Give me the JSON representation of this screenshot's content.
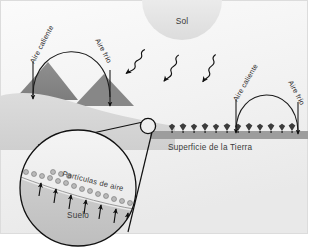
{
  "figure": {
    "title_visible": false,
    "language": "es",
    "background_color": "#f6f6f6",
    "frame_color": "#d8d8d8"
  },
  "sun": {
    "label": "Sol",
    "shape": "half-circle",
    "fill_color": "#e3e3e3"
  },
  "rays": {
    "icon_name": "wavy-ray-arrow",
    "count": 3,
    "direction": "down-left",
    "color": "#111111"
  },
  "left_cell": {
    "hot_label": "Aire caliente",
    "cold_label": "Aire frío",
    "terrain": "mountains",
    "terrain_color": "#8a8a8a"
  },
  "right_cell": {
    "hot_label": "Aire caliente",
    "cold_label": "Aire frío",
    "terrain": "trees",
    "terrain_color": "#3c3c3c"
  },
  "ground": {
    "surface_label": "Superficie de la Tierra",
    "band_color": "#9d9d9d"
  },
  "magnifier": {
    "particles_label": "Partículas de aire",
    "soil_label": "Suelo",
    "particle_count": 17,
    "soil_arrow_count": 7,
    "particle_color": "#b9b9b9",
    "outline_color": "#111111"
  },
  "colors": {
    "ink": "#1c1c1c",
    "mid_gray": "#8a8a8a",
    "light_gray": "#d5d5d5",
    "pale": "#ededed"
  }
}
